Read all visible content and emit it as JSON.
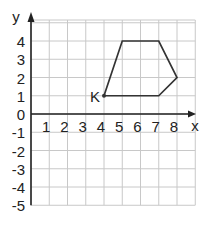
{
  "chart_data": {
    "type": "line",
    "title": "",
    "xlabel": "x",
    "ylabel": "y",
    "xlim": [
      0,
      9
    ],
    "ylim": [
      -5,
      5
    ],
    "grid": true,
    "x_ticks": [
      "1",
      "2",
      "3",
      "4",
      "5",
      "6",
      "7",
      "8"
    ],
    "y_ticks": [
      "4",
      "3",
      "2",
      "1",
      "0",
      "-1",
      "-2",
      "-3",
      "-4",
      "-5"
    ],
    "series": [
      {
        "name": "polygon",
        "closed": true,
        "points": [
          [
            4,
            1
          ],
          [
            5,
            4
          ],
          [
            7,
            4
          ],
          [
            8,
            2
          ],
          [
            7,
            1
          ]
        ]
      }
    ],
    "annotations": [
      {
        "text": "K",
        "point": [
          4,
          1
        ]
      }
    ],
    "colors": {
      "grid": "#c8c8c8",
      "axis": "#222222",
      "shape": "#333333"
    }
  }
}
